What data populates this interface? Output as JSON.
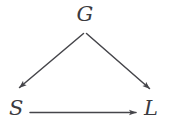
{
  "diagram": {
    "type": "directed-acyclic-graph",
    "background_color": "#ffffff",
    "stroke_color": "#45454a",
    "label_color": "#3b3b3f",
    "nodes": [
      {
        "id": "G",
        "label": "G",
        "position": "top-center"
      },
      {
        "id": "S",
        "label": "S",
        "position": "bottom-left"
      },
      {
        "id": "L",
        "label": "L",
        "position": "bottom-right"
      }
    ],
    "edges": [
      {
        "from": "G",
        "to": "S",
        "style": "solid",
        "arrowhead": "filled",
        "direction": "down-left"
      },
      {
        "from": "G",
        "to": "L",
        "style": "solid",
        "arrowhead": "filled",
        "direction": "down-right"
      },
      {
        "from": "S",
        "to": "L",
        "style": "solid",
        "arrowhead": "filled",
        "direction": "right"
      }
    ]
  }
}
